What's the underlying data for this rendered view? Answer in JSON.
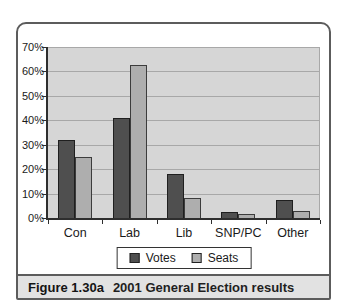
{
  "figure": {
    "caption_label": "Figure 1.30a",
    "caption_title": "2001 General Election results"
  },
  "chart_data": {
    "type": "bar",
    "title": "2001 General Election results",
    "categories": [
      "Con",
      "Lab",
      "Lib",
      "SNP/PC",
      "Other"
    ],
    "series": [
      {
        "name": "Votes",
        "values": [
          32,
          41,
          18,
          2.5,
          7.5
        ],
        "color": "#4f4f4f",
        "border": "#1f1f1f"
      },
      {
        "name": "Seats",
        "values": [
          25,
          62.5,
          8,
          1.5,
          3
        ],
        "color": "#aeaeae",
        "border": "#3c3c3c"
      }
    ],
    "xlabel": "",
    "ylabel": "",
    "ylim": [
      0,
      70
    ],
    "yticks": [
      "70%",
      "60%",
      "50%",
      "40%",
      "30%",
      "20%",
      "10%",
      "0%"
    ],
    "grid": true,
    "legend_position": "bottom-center"
  },
  "colors": {
    "plot_bg": "#d6d6d6",
    "gridline": "#a8a8a8",
    "axis": "#2e2e2e",
    "figure_border": "#5c5c5c",
    "caption_bg": "#e2e2e2",
    "legend_bg": "#ffffff",
    "legend_border": "#333333",
    "text": "#1a1a1a"
  }
}
